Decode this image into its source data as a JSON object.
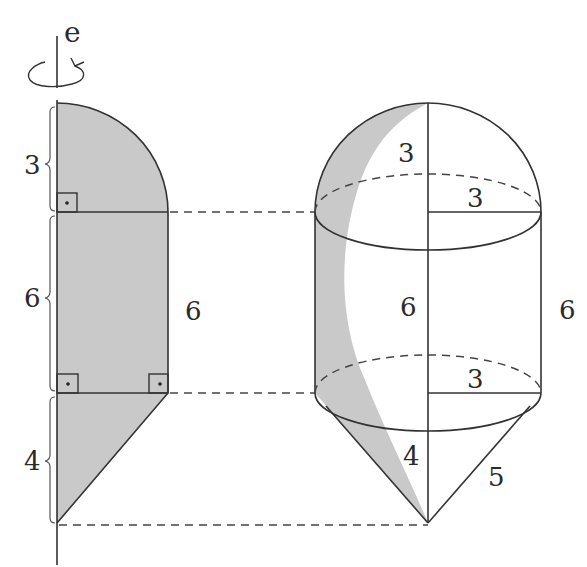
{
  "figure": {
    "axis": {
      "label": "e",
      "rotation_symbol": "rotation-arrow"
    },
    "left_profile": {
      "description": "shaded cross-section rotated about axis e",
      "segments": [
        {
          "name": "quarter-circle",
          "height_label": "3"
        },
        {
          "name": "rectangle",
          "height_label": "6",
          "side_label": "6"
        },
        {
          "name": "right-triangle",
          "height_label": "4"
        }
      ],
      "right_angle_markers": 3
    },
    "solid": {
      "description": "hemisphere + cylinder + cone solid of revolution",
      "hemisphere": {
        "height_label": "3",
        "radius_label": "3"
      },
      "cylinder": {
        "height_label": "6",
        "side_label": "6",
        "radius_label": "3"
      },
      "cone": {
        "height_label": "4",
        "slant_label": "5"
      }
    },
    "colors": {
      "shade": "#c9c9c9",
      "line": "#333333",
      "background": "#ffffff"
    }
  }
}
